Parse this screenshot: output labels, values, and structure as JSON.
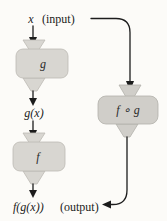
{
  "labels": {
    "input_var": "x",
    "input_annotation": "(input)",
    "machine_g": "g",
    "intermediate_expr": "g(x)",
    "machine_f": "f",
    "output_expr": "f(g(x))",
    "output_annotation": "(output)",
    "machine_fog": "f ∘ g"
  },
  "colors": {
    "background": "#fcfbf8",
    "machine_fill_left": "#d8d6d1",
    "machine_fill_right": "#d0cec9",
    "line": "#1c1c1c",
    "text": "#1b1b1b"
  }
}
